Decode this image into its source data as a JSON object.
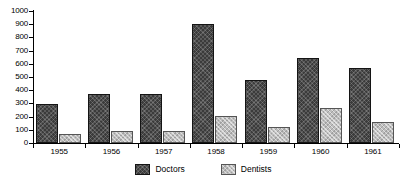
{
  "chart_data": {
    "type": "bar",
    "title": "",
    "subtitle": "",
    "xlabel": "",
    "ylabel": "",
    "categories": [
      "1955",
      "1956",
      "1957",
      "1958",
      "1959",
      "1960",
      "1961"
    ],
    "series": [
      {
        "name": "Doctors",
        "color": "#3b3b3b",
        "values": [
          295,
          375,
          375,
          900,
          480,
          645,
          570
        ]
      },
      {
        "name": "Dentists",
        "color": "#bdbdbd",
        "values": [
          70,
          92,
          92,
          205,
          120,
          265,
          160
        ]
      }
    ],
    "ylim": [
      0,
      1000
    ],
    "yticks": [
      0,
      100,
      200,
      300,
      400,
      500,
      600,
      700,
      800,
      900,
      1000
    ],
    "ytick_labels": [
      "0",
      "100",
      "200",
      "300",
      "400",
      "500",
      "600",
      "700",
      "800",
      "900",
      "1000"
    ],
    "grid": false,
    "legend_position": "bottom-center",
    "legend_entries": [
      "Doctors",
      "Dentists"
    ]
  },
  "legend": {
    "doctors_label": "Doctors",
    "dentists_label": "Dentists"
  },
  "colors": {
    "doctors": "#3b3b3b",
    "dentists": "#bdbdbd",
    "axis": "#000000",
    "background": "#ffffff"
  }
}
